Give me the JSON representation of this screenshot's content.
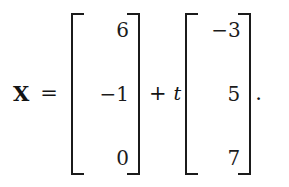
{
  "equation": {
    "variable": "X",
    "equals": "=",
    "operator_plus": "+",
    "scalar": "t",
    "terminator": ".",
    "point_vector": {
      "name": "point-vector",
      "entries": [
        "6",
        "−1",
        "0"
      ]
    },
    "direction_vector": {
      "name": "direction-vector",
      "entries": [
        "−3",
        "5",
        "7"
      ]
    },
    "colors": {
      "ink": "#1b1b1b",
      "background": "#ffffff"
    }
  }
}
